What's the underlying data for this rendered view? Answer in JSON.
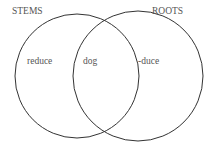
{
  "diagram": {
    "type": "venn",
    "sets": [
      {
        "label": "STEMS",
        "only_items": [
          "reduce"
        ]
      },
      {
        "label": "ROOTS",
        "only_items": [
          "-duce"
        ]
      }
    ],
    "intersection_items": [
      "dog"
    ]
  },
  "labels": {
    "stems": "STEMS",
    "roots": "ROOTS",
    "left_item": "reduce",
    "center_item": "dog",
    "right_item": "-duce"
  },
  "colors": {
    "stroke": "#333333",
    "text": "#555555",
    "background": "#ffffff"
  }
}
